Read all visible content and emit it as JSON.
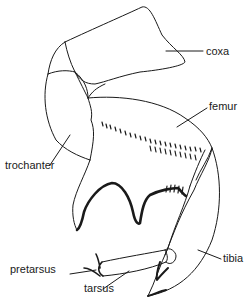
{
  "diagram": {
    "labels": {
      "coxa": "coxa",
      "femur": "femur",
      "trochanter": "trochanter",
      "tibia": "tibia",
      "pretarsus": "pretarsus",
      "tarsus": "tarsus"
    },
    "colors": {
      "line": "#1a1a1a",
      "background": "#ffffff"
    }
  }
}
